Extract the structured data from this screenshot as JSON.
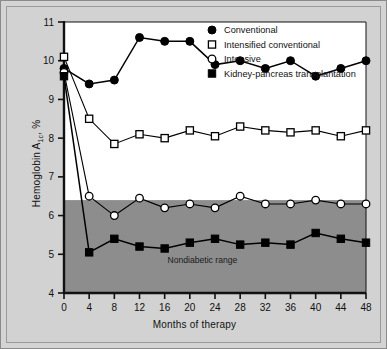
{
  "figure": {
    "background_color": "#d2d2d2",
    "plot_background_color": "#ffffff",
    "band_color": "#8d8d8d",
    "border_color": "#9a9a9a"
  },
  "axes": {
    "x_title": "Months of therapy",
    "y_title_main": "Hemoglobin A",
    "y_title_sub": "1c",
    "y_title_tail": ", %",
    "x_ticks": [
      "0",
      "4",
      "8",
      "12",
      "16",
      "20",
      "24",
      "28",
      "32",
      "36",
      "40",
      "44",
      "48"
    ],
    "y_ticks": [
      "4",
      "5",
      "6",
      "7",
      "8",
      "9",
      "10",
      "11"
    ]
  },
  "band": {
    "label": "Nondiabetic range",
    "y_min": 4,
    "y_max": 6.4
  },
  "legend": {
    "items": [
      {
        "label": "Conventional",
        "marker": "filled-circle",
        "color": "#000000"
      },
      {
        "label": "Intensified conventional",
        "marker": "open-square",
        "color": "#000000"
      },
      {
        "label": "Intensive",
        "marker": "open-circle",
        "color": "#000000"
      },
      {
        "label": "Kidney-pancreas transplantation",
        "marker": "filled-square",
        "color": "#000000"
      }
    ]
  },
  "chart_data": {
    "type": "line",
    "title": "",
    "xlabel": "Months of therapy",
    "ylabel": "Hemoglobin A1c, %",
    "x": [
      0,
      4,
      8,
      12,
      16,
      20,
      24,
      28,
      32,
      36,
      40,
      44,
      48
    ],
    "xlim": [
      0,
      48
    ],
    "ylim": [
      4,
      11
    ],
    "grid": false,
    "legend_position": "top-right",
    "annotations": [
      {
        "text": "Nondiabetic range",
        "x": 22,
        "y": 4.75
      }
    ],
    "shaded_region": {
      "label": "Nondiabetic range",
      "y_from": 4,
      "y_to": 6.4
    },
    "series": [
      {
        "name": "Conventional",
        "marker": "filled-circle",
        "values": [
          9.8,
          9.4,
          9.5,
          10.6,
          10.5,
          10.5,
          9.9,
          10.0,
          9.8,
          10.0,
          9.6,
          9.8,
          10.0
        ]
      },
      {
        "name": "Intensified conventional",
        "marker": "open-square",
        "values": [
          10.1,
          8.5,
          7.85,
          8.1,
          8.0,
          8.2,
          8.05,
          8.3,
          8.2,
          8.15,
          8.2,
          8.05,
          8.2
        ]
      },
      {
        "name": "Intensive",
        "marker": "open-circle",
        "values": [
          9.7,
          6.5,
          6.0,
          6.45,
          6.2,
          6.3,
          6.2,
          6.5,
          6.3,
          6.3,
          6.4,
          6.3,
          6.3
        ]
      },
      {
        "name": "Kidney-pancreas transplantation",
        "marker": "filled-square",
        "values": [
          9.6,
          5.05,
          5.4,
          5.2,
          5.15,
          5.3,
          5.4,
          5.25,
          5.3,
          5.25,
          5.55,
          5.4,
          5.3
        ]
      }
    ]
  }
}
